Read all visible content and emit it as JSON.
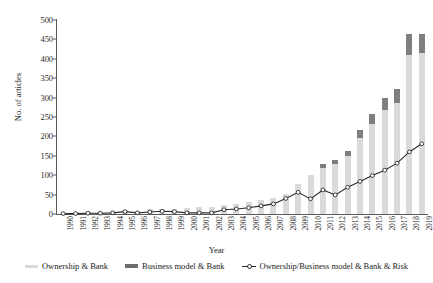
{
  "chart_data": {
    "type": "bar",
    "title": "",
    "xlabel": "Year",
    "ylabel": "No. of articles",
    "ylim": [
      0,
      500
    ],
    "yticks": [
      0,
      50,
      100,
      150,
      200,
      250,
      300,
      350,
      400,
      450,
      500
    ],
    "grid": false,
    "legend_position": "bottom",
    "stacked": true,
    "categories": [
      "1990",
      "1991",
      "1992",
      "1993",
      "1994",
      "1995",
      "1996",
      "1997",
      "1998",
      "1999",
      "2000",
      "2001",
      "2002",
      "2003",
      "2004",
      "2005",
      "2006",
      "2007",
      "2008",
      "2009",
      "2010",
      "2011",
      "2012",
      "2013",
      "2014",
      "2015",
      "2016",
      "2017",
      "2018",
      "2019"
    ],
    "series": [
      {
        "name": "Ownership & Bank",
        "kind": "bar",
        "color": "#dadada",
        "values": [
          3,
          4,
          6,
          5,
          7,
          10,
          9,
          12,
          14,
          13,
          16,
          18,
          17,
          22,
          26,
          30,
          36,
          40,
          52,
          78,
          100,
          118,
          130,
          150,
          196,
          232,
          268,
          286,
          410,
          415
        ]
      },
      {
        "name": "Business model & Bank",
        "kind": "bar",
        "color": "#7f7f7f",
        "values": [
          0,
          0,
          0,
          0,
          0,
          0,
          0,
          0,
          0,
          0,
          0,
          0,
          0,
          0,
          0,
          0,
          0,
          0,
          0,
          0,
          0,
          10,
          10,
          12,
          20,
          26,
          32,
          36,
          55,
          50
        ]
      },
      {
        "name": "Ownership/Business model & Bank & Risk",
        "kind": "line",
        "color": "#2b2b2b",
        "values": [
          1,
          1,
          2,
          2,
          3,
          6,
          3,
          5,
          7,
          6,
          3,
          3,
          3,
          11,
          13,
          16,
          21,
          26,
          40,
          56,
          39,
          62,
          49,
          69,
          84,
          99,
          113,
          131,
          160,
          181
        ]
      }
    ],
    "legend": [
      "Ownership & Bank",
      "Business model & Bank",
      "Ownership/Business model & Bank & Risk"
    ]
  }
}
